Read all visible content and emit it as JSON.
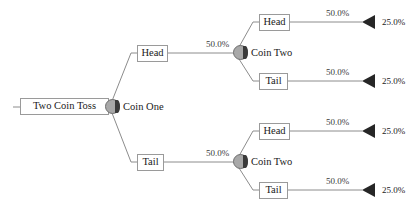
{
  "diagram": {
    "type": "probability-tree",
    "title": "Two Coin Toss",
    "background": "#ffffff",
    "line_color": "#8c8c8c",
    "node_fill": "#a8a8a8",
    "arrow_color": "#262626",
    "root": {
      "box_label": "Two Coin Toss",
      "chance_label": "Coin One"
    },
    "branches": [
      {
        "outcome_label": "Head",
        "edge_label": "50.0%",
        "chance_label": "Coin Two",
        "leaves": [
          {
            "outcome_label": "Head",
            "edge_label": "50.0%",
            "value_label": "25.0%"
          },
          {
            "outcome_label": "Tail",
            "edge_label": "50.0%",
            "value_label": "25.0%"
          }
        ]
      },
      {
        "outcome_label": "Tail",
        "edge_label": "50.0%",
        "chance_label": "Coin Two",
        "leaves": [
          {
            "outcome_label": "Head",
            "edge_label": "50.0%",
            "value_label": "25.0%"
          },
          {
            "outcome_label": "Tail",
            "edge_label": "50.0%",
            "value_label": "25.0%"
          }
        ]
      }
    ]
  }
}
